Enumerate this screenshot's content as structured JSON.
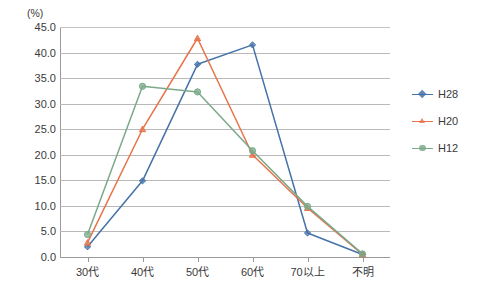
{
  "chart_data": {
    "type": "line",
    "title": "",
    "subtitle": "",
    "xlabel": "",
    "ylabel": "(%)",
    "unit_label": "(%)",
    "categories": [
      "30代",
      "40代",
      "50代",
      "60代",
      "70以上",
      "不明"
    ],
    "ylim": [
      0.0,
      45.0
    ],
    "ytick_step": 5.0,
    "yticks": [
      "0.0",
      "5.0",
      "10.0",
      "15.0",
      "20.0",
      "25.0",
      "30.0",
      "35.0",
      "40.0",
      "45.0"
    ],
    "ytick_values": [
      0.0,
      5.0,
      10.0,
      15.0,
      20.0,
      25.0,
      30.0,
      35.0,
      40.0,
      45.0
    ],
    "grid": true,
    "grid_axis": "y",
    "legend_position": "right",
    "series": [
      {
        "name": "H28",
        "color": "#4472a8",
        "marker": "diamond",
        "values": [
          2.0,
          14.9,
          37.7,
          41.5,
          4.7,
          0.5
        ]
      },
      {
        "name": "H20",
        "color": "#e8734a",
        "marker": "triangle",
        "values": [
          2.8,
          25.0,
          42.8,
          20.0,
          9.6,
          0.5
        ]
      },
      {
        "name": "H12",
        "color": "#7ba98a",
        "marker": "circle",
        "values": [
          4.4,
          33.4,
          32.3,
          20.8,
          9.9,
          0.6
        ]
      }
    ]
  },
  "legend": {
    "items": [
      {
        "label": "H28",
        "color": "#4472a8"
      },
      {
        "label": "H20",
        "color": "#e8734a"
      },
      {
        "label": "H12",
        "color": "#7ba98a"
      }
    ]
  }
}
